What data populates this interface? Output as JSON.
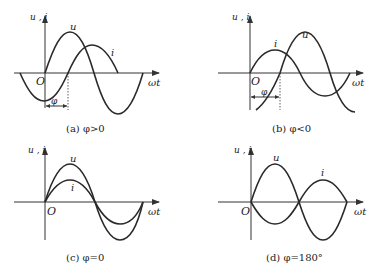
{
  "panels": [
    {
      "id": "a",
      "y_axis_label": "u , i",
      "x_axis_label": "ωt",
      "origin_label": "O",
      "curve_labels": {
        "u": "u",
        "i": "i"
      },
      "phase_label": "φ",
      "caption": "(a) φ>0"
    },
    {
      "id": "b",
      "y_axis_label": "u , i",
      "x_axis_label": "ωt",
      "origin_label": "O",
      "curve_labels": {
        "u": "u",
        "i": "i"
      },
      "phase_label": "φ",
      "caption": "(b) φ<0"
    },
    {
      "id": "c",
      "y_axis_label": "u , i",
      "x_axis_label": "ωt",
      "origin_label": "O",
      "curve_labels": {
        "u": "u",
        "i": "i"
      },
      "caption": "(c) φ=0"
    },
    {
      "id": "d",
      "y_axis_label": "u , i",
      "x_axis_label": "ωt",
      "origin_label": "O",
      "curve_labels": {
        "u": "u",
        "i": "i"
      },
      "caption": "(d) φ=180°"
    }
  ]
}
